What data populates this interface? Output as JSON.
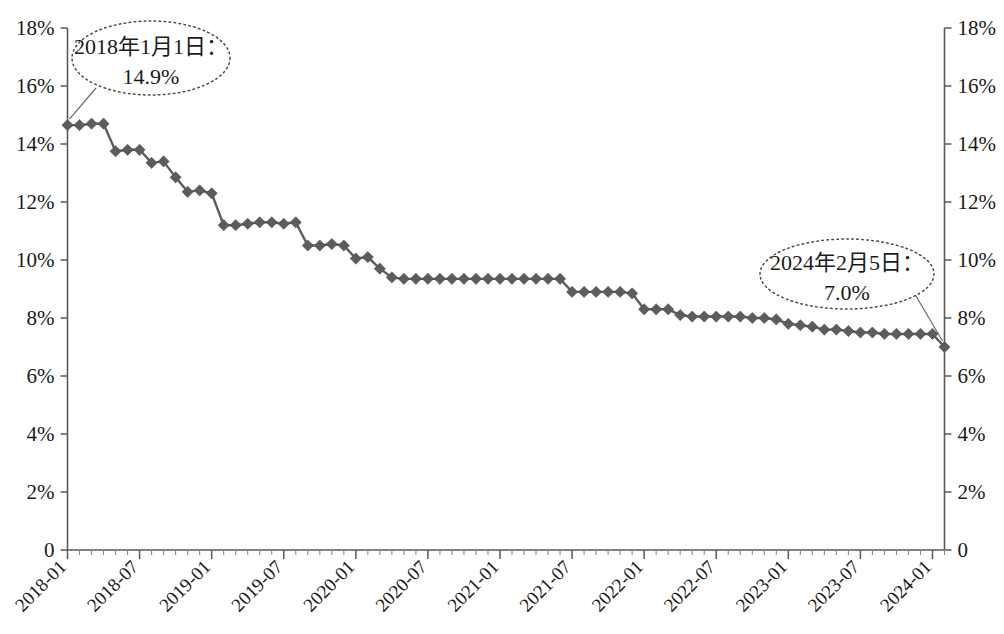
{
  "chart_data": {
    "type": "line",
    "title": "",
    "subtitle": "",
    "xlabel": "",
    "ylabel": "",
    "ylim": [
      0,
      18
    ],
    "y_tick_labels": [
      "0",
      "2%",
      "4%",
      "6%",
      "8%",
      "10%",
      "12%",
      "14%",
      "16%",
      "18%"
    ],
    "y_tick_values": [
      0,
      2,
      4,
      6,
      8,
      10,
      12,
      14,
      16,
      18
    ],
    "right_axis": true,
    "right_y_tick_labels": [
      "0",
      "2%",
      "4%",
      "6%",
      "8%",
      "10%",
      "12%",
      "14%",
      "16%",
      "18%"
    ],
    "grid": false,
    "legend": null,
    "x_tick_labels": [
      "2018-01",
      "2018-07",
      "2019-01",
      "2019-07",
      "2020-01",
      "2020-07",
      "2021-01",
      "2021-07",
      "2022-01",
      "2022-07",
      "2023-01",
      "2023-07",
      "2024-01"
    ],
    "x_tick_rotation": 45,
    "marker": "diamond",
    "series_color": "#5c5c5c",
    "x": [
      "2018-01",
      "2018-02",
      "2018-03",
      "2018-04",
      "2018-05",
      "2018-06",
      "2018-07",
      "2018-08",
      "2018-09",
      "2018-10",
      "2018-11",
      "2018-12",
      "2019-01",
      "2019-02",
      "2019-03",
      "2019-04",
      "2019-05",
      "2019-06",
      "2019-07",
      "2019-08",
      "2019-09",
      "2019-10",
      "2019-11",
      "2019-12",
      "2020-01",
      "2020-02",
      "2020-03",
      "2020-04",
      "2020-05",
      "2020-06",
      "2020-07",
      "2020-08",
      "2020-09",
      "2020-10",
      "2020-11",
      "2020-12",
      "2021-01",
      "2021-02",
      "2021-03",
      "2021-04",
      "2021-05",
      "2021-06",
      "2021-07",
      "2021-08",
      "2021-09",
      "2021-10",
      "2021-11",
      "2021-12",
      "2022-01",
      "2022-02",
      "2022-03",
      "2022-04",
      "2022-05",
      "2022-06",
      "2022-07",
      "2022-08",
      "2022-09",
      "2022-10",
      "2022-11",
      "2022-12",
      "2023-01",
      "2023-02",
      "2023-03",
      "2023-04",
      "2023-05",
      "2023-06",
      "2023-07",
      "2023-08",
      "2023-09",
      "2023-10",
      "2023-11",
      "2023-12",
      "2024-01",
      "2024-02"
    ],
    "values": [
      14.65,
      14.65,
      14.7,
      14.7,
      13.75,
      13.8,
      13.8,
      13.35,
      13.4,
      12.85,
      12.35,
      12.4,
      12.3,
      11.2,
      11.2,
      11.25,
      11.3,
      11.3,
      11.25,
      11.3,
      10.5,
      10.5,
      10.55,
      10.5,
      10.05,
      10.1,
      9.7,
      9.4,
      9.35,
      9.35,
      9.35,
      9.35,
      9.35,
      9.35,
      9.35,
      9.35,
      9.35,
      9.35,
      9.35,
      9.35,
      9.35,
      9.35,
      8.9,
      8.9,
      8.9,
      8.9,
      8.9,
      8.85,
      8.3,
      8.3,
      8.3,
      8.1,
      8.05,
      8.05,
      8.05,
      8.05,
      8.05,
      8.0,
      8.0,
      7.95,
      7.8,
      7.75,
      7.7,
      7.6,
      7.6,
      7.55,
      7.5,
      7.5,
      7.45,
      7.45,
      7.45,
      7.45,
      7.45,
      7.0
    ]
  },
  "annotations": {
    "start": {
      "line1": "2018年1月1日：",
      "line2": "14.9%",
      "target_x": "2018-01",
      "target_value": 14.9
    },
    "end": {
      "line1": "2024年2月5日：",
      "line2": "7.0%",
      "target_x": "2024-02",
      "target_value": 7.0
    }
  }
}
